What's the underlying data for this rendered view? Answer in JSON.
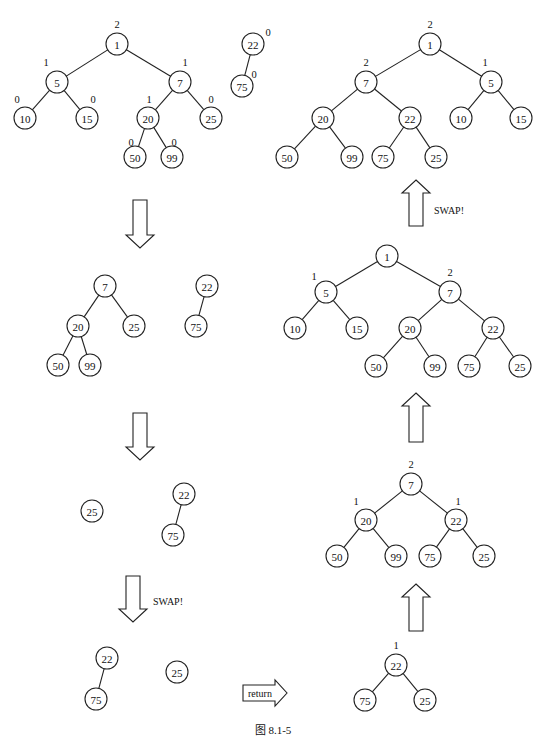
{
  "figure": {
    "caption": "图    8.1-5",
    "node_radius": 11,
    "trees": [
      {
        "id": "step1-left-heap",
        "nodes": [
          {
            "id": "a1",
            "value": "1",
            "x": 117,
            "y": 44,
            "label": "2",
            "lx": 117,
            "ly": 28
          },
          {
            "id": "a5",
            "value": "5",
            "x": 57,
            "y": 82,
            "label": "1",
            "lx": 46,
            "ly": 66
          },
          {
            "id": "a7",
            "value": "7",
            "x": 180,
            "y": 82,
            "label": "1",
            "lx": 185,
            "ly": 66
          },
          {
            "id": "a10",
            "value": "10",
            "x": 25,
            "y": 118,
            "label": "0",
            "lx": 17,
            "ly": 103
          },
          {
            "id": "a15",
            "value": "15",
            "x": 87,
            "y": 118,
            "label": "0",
            "lx": 93,
            "ly": 103
          },
          {
            "id": "a20",
            "value": "20",
            "x": 148,
            "y": 118,
            "label": "1",
            "lx": 149,
            "ly": 103
          },
          {
            "id": "a25",
            "value": "25",
            "x": 211,
            "y": 118,
            "label": "0",
            "lx": 211,
            "ly": 103
          },
          {
            "id": "a50",
            "value": "50",
            "x": 135,
            "y": 157,
            "label": "0",
            "lx": 131,
            "ly": 146
          },
          {
            "id": "a99",
            "value": "99",
            "x": 172,
            "y": 157,
            "label": "0",
            "lx": 174,
            "ly": 146
          }
        ],
        "edges": [
          [
            "a1",
            "a5"
          ],
          [
            "a1",
            "a7"
          ],
          [
            "a5",
            "a10"
          ],
          [
            "a5",
            "a15"
          ],
          [
            "a7",
            "a20"
          ],
          [
            "a7",
            "a25"
          ],
          [
            "a20",
            "a50"
          ],
          [
            "a20",
            "a99"
          ]
        ]
      },
      {
        "id": "step1-right-heap",
        "nodes": [
          {
            "id": "b22",
            "value": "22",
            "x": 253,
            "y": 44,
            "label": "0",
            "lx": 268,
            "ly": 36
          },
          {
            "id": "b75",
            "value": "75",
            "x": 242,
            "y": 86,
            "label": "0",
            "lx": 254,
            "ly": 78
          }
        ],
        "edges": [
          [
            "b22",
            "b75"
          ]
        ]
      },
      {
        "id": "step2-left-heap",
        "nodes": [
          {
            "id": "c7",
            "value": "7",
            "x": 105,
            "y": 286
          },
          {
            "id": "c20",
            "value": "20",
            "x": 78,
            "y": 326
          },
          {
            "id": "c25",
            "value": "25",
            "x": 134,
            "y": 326
          },
          {
            "id": "c50",
            "value": "50",
            "x": 58,
            "y": 365
          },
          {
            "id": "c99",
            "value": "99",
            "x": 90,
            "y": 365
          }
        ],
        "edges": [
          [
            "c7",
            "c20"
          ],
          [
            "c7",
            "c25"
          ],
          [
            "c20",
            "c50"
          ],
          [
            "c20",
            "c99"
          ]
        ]
      },
      {
        "id": "step2-right-heap",
        "nodes": [
          {
            "id": "d22",
            "value": "22",
            "x": 207,
            "y": 286
          },
          {
            "id": "d75",
            "value": "75",
            "x": 196,
            "y": 326
          }
        ],
        "edges": [
          [
            "d22",
            "d75"
          ]
        ]
      },
      {
        "id": "step3-left-heap",
        "nodes": [
          {
            "id": "e25",
            "value": "25",
            "x": 92,
            "y": 511
          }
        ],
        "edges": []
      },
      {
        "id": "step3-right-heap",
        "nodes": [
          {
            "id": "f22",
            "value": "22",
            "x": 184,
            "y": 494
          },
          {
            "id": "f75",
            "value": "75",
            "x": 173,
            "y": 535
          }
        ],
        "edges": [
          [
            "f22",
            "f75"
          ]
        ]
      },
      {
        "id": "step4-left-heap",
        "nodes": [
          {
            "id": "g22",
            "value": "22",
            "x": 107,
            "y": 658
          },
          {
            "id": "g75",
            "value": "75",
            "x": 96,
            "y": 699
          }
        ],
        "edges": [
          [
            "g22",
            "g75"
          ]
        ]
      },
      {
        "id": "step4-right-heap",
        "nodes": [
          {
            "id": "h25",
            "value": "25",
            "x": 177,
            "y": 672
          }
        ],
        "edges": []
      },
      {
        "id": "merge-result-1",
        "nodes": [
          {
            "id": "i22",
            "value": "22",
            "x": 396,
            "y": 665,
            "label": "1",
            "lx": 396,
            "ly": 649
          },
          {
            "id": "i75",
            "value": "75",
            "x": 365,
            "y": 700
          },
          {
            "id": "i25",
            "value": "25",
            "x": 425,
            "y": 700
          }
        ],
        "edges": [
          [
            "i22",
            "i75"
          ],
          [
            "i22",
            "i25"
          ]
        ]
      },
      {
        "id": "merge-result-2",
        "nodes": [
          {
            "id": "j7",
            "value": "7",
            "x": 411,
            "y": 484,
            "label": "2",
            "lx": 411,
            "ly": 468
          },
          {
            "id": "j20",
            "value": "20",
            "x": 366,
            "y": 520,
            "label": "1",
            "lx": 356,
            "ly": 505
          },
          {
            "id": "j22",
            "value": "22",
            "x": 456,
            "y": 520,
            "label": "1",
            "lx": 458,
            "ly": 505
          },
          {
            "id": "j50",
            "value": "50",
            "x": 337,
            "y": 556
          },
          {
            "id": "j99",
            "value": "99",
            "x": 396,
            "y": 556
          },
          {
            "id": "j75",
            "value": "75",
            "x": 430,
            "y": 556
          },
          {
            "id": "j25",
            "value": "25",
            "x": 484,
            "y": 556
          }
        ],
        "edges": [
          [
            "j7",
            "j20"
          ],
          [
            "j7",
            "j22"
          ],
          [
            "j20",
            "j50"
          ],
          [
            "j20",
            "j99"
          ],
          [
            "j22",
            "j75"
          ],
          [
            "j22",
            "j25"
          ]
        ]
      },
      {
        "id": "merge-result-3",
        "nodes": [
          {
            "id": "k1",
            "value": "1",
            "x": 387,
            "y": 256
          },
          {
            "id": "k5",
            "value": "5",
            "x": 326,
            "y": 292,
            "label": "1",
            "lx": 314,
            "ly": 280
          },
          {
            "id": "k7",
            "value": "7",
            "x": 450,
            "y": 292,
            "label": "2",
            "lx": 450,
            "ly": 276
          },
          {
            "id": "k10",
            "value": "10",
            "x": 295,
            "y": 328
          },
          {
            "id": "k15",
            "value": "15",
            "x": 357,
            "y": 328
          },
          {
            "id": "k20",
            "value": "20",
            "x": 410,
            "y": 328
          },
          {
            "id": "k22",
            "value": "22",
            "x": 493,
            "y": 328
          },
          {
            "id": "k50",
            "value": "50",
            "x": 376,
            "y": 366
          },
          {
            "id": "k99",
            "value": "99",
            "x": 435,
            "y": 366
          },
          {
            "id": "k75",
            "value": "75",
            "x": 469,
            "y": 366
          },
          {
            "id": "k25",
            "value": "25",
            "x": 520,
            "y": 366
          }
        ],
        "edges": [
          [
            "k1",
            "k5"
          ],
          [
            "k1",
            "k7"
          ],
          [
            "k5",
            "k10"
          ],
          [
            "k5",
            "k15"
          ],
          [
            "k7",
            "k20"
          ],
          [
            "k7",
            "k22"
          ],
          [
            "k20",
            "k50"
          ],
          [
            "k20",
            "k99"
          ],
          [
            "k22",
            "k75"
          ],
          [
            "k22",
            "k25"
          ]
        ]
      },
      {
        "id": "final-heap",
        "nodes": [
          {
            "id": "m1",
            "value": "1",
            "x": 430,
            "y": 44,
            "label": "2",
            "lx": 430,
            "ly": 28
          },
          {
            "id": "m7",
            "value": "7",
            "x": 366,
            "y": 82,
            "label": "2",
            "lx": 366,
            "ly": 66
          },
          {
            "id": "m5",
            "value": "5",
            "x": 491,
            "y": 82,
            "label": "1",
            "lx": 485,
            "ly": 66
          },
          {
            "id": "m20",
            "value": "20",
            "x": 323,
            "y": 118
          },
          {
            "id": "m22",
            "value": "22",
            "x": 410,
            "y": 118
          },
          {
            "id": "m10",
            "value": "10",
            "x": 461,
            "y": 118
          },
          {
            "id": "m15",
            "value": "15",
            "x": 521,
            "y": 118
          },
          {
            "id": "m50",
            "value": "50",
            "x": 287,
            "y": 157
          },
          {
            "id": "m99",
            "value": "99",
            "x": 352,
            "y": 157
          },
          {
            "id": "m75",
            "value": "75",
            "x": 383,
            "y": 157
          },
          {
            "id": "m25",
            "value": "25",
            "x": 436,
            "y": 157
          }
        ],
        "edges": [
          [
            "m1",
            "m7"
          ],
          [
            "m1",
            "m5"
          ],
          [
            "m7",
            "m20"
          ],
          [
            "m7",
            "m22"
          ],
          [
            "m5",
            "m10"
          ],
          [
            "m5",
            "m15"
          ],
          [
            "m20",
            "m50"
          ],
          [
            "m20",
            "m99"
          ],
          [
            "m22",
            "m75"
          ],
          [
            "m22",
            "m25"
          ]
        ]
      }
    ],
    "arrows": [
      {
        "id": "arrow-down-1",
        "dir": "down",
        "x": 140,
        "y1": 200,
        "y2": 248,
        "text": ""
      },
      {
        "id": "arrow-down-2",
        "dir": "down",
        "x": 140,
        "y1": 413,
        "y2": 460,
        "text": ""
      },
      {
        "id": "arrow-down-swap",
        "dir": "down",
        "x": 133,
        "y1": 576,
        "y2": 622,
        "text": "SWAP!",
        "tx": 153,
        "ty": 605
      },
      {
        "id": "arrow-return",
        "dir": "right",
        "y": 693,
        "x1": 243,
        "x2": 287,
        "text": "return",
        "tx": 248,
        "ty": 697
      },
      {
        "id": "arrow-up-1",
        "dir": "up",
        "x": 416,
        "y1": 584,
        "y2": 631,
        "text": ""
      },
      {
        "id": "arrow-up-2",
        "dir": "up",
        "x": 416,
        "y1": 393,
        "y2": 442,
        "text": ""
      },
      {
        "id": "arrow-up-swap",
        "dir": "up",
        "x": 416,
        "y1": 180,
        "y2": 226,
        "text": "SWAP!",
        "tx": 434,
        "ty": 214
      }
    ]
  }
}
